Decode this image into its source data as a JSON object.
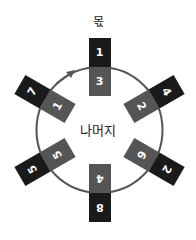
{
  "title": "몫",
  "center_label": "나머지",
  "colors": {
    "quotient_cell": "#1a1a1a",
    "remainder_cell": "#555555",
    "circle": "#555555"
  },
  "pairs": [
    {
      "quotient": "1",
      "remainder": "3",
      "angle": 0
    },
    {
      "quotient": "4",
      "remainder": "2",
      "angle": 60
    },
    {
      "quotient": "2",
      "remainder": "6",
      "angle": 120
    },
    {
      "quotient": "8",
      "remainder": "4",
      "angle": 180
    },
    {
      "quotient": "5",
      "remainder": "5",
      "angle": 240
    },
    {
      "quotient": "7",
      "remainder": "1",
      "angle": 300
    }
  ],
  "arrow": {
    "direction": "clockwise"
  }
}
